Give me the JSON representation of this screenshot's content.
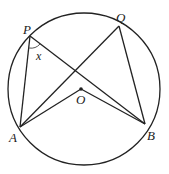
{
  "diagram": {
    "type": "circle-geometry",
    "circle": {
      "cx": 84,
      "cy": 89,
      "r": 76
    },
    "points": {
      "P": {
        "label": "P",
        "x": 30,
        "y": 36
      },
      "Q": {
        "label": "Q",
        "x": 119,
        "y": 26
      },
      "A": {
        "label": "A",
        "x": 20,
        "y": 127
      },
      "B": {
        "label": "B",
        "x": 145,
        "y": 124
      },
      "O": {
        "label": "O",
        "x": 81,
        "y": 89
      }
    },
    "angle_label": "x",
    "segments": [
      "PA",
      "PB",
      "QA",
      "QB",
      "AO",
      "OB"
    ],
    "stroke_color": "#222222"
  }
}
